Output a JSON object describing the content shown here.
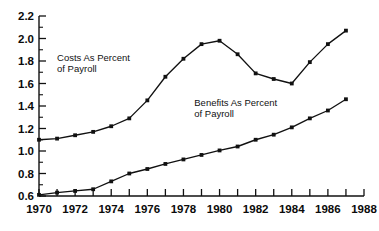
{
  "chart_data": {
    "type": "line",
    "title": "",
    "subtitle": "",
    "xlabel": "",
    "ylabel": "",
    "xlim": [
      1970,
      1988
    ],
    "ylim": [
      0.6,
      2.2
    ],
    "grid": false,
    "legend_position": "inline-annotation",
    "x_tick_interval": 1,
    "x_label_interval": 2,
    "y_major_interval": 0.2,
    "y_minor_interval": 0.1,
    "marker": "filled-square",
    "line_color": "#111111",
    "x": [
      1970,
      1971,
      1972,
      1973,
      1974,
      1975,
      1976,
      1977,
      1978,
      1979,
      1980,
      1981,
      1982,
      1983,
      1984,
      1985,
      1986,
      1987
    ],
    "xtick_values": [
      1970,
      1971,
      1972,
      1973,
      1974,
      1975,
      1976,
      1977,
      1978,
      1979,
      1980,
      1981,
      1982,
      1983,
      1984,
      1985,
      1986,
      1987,
      1988
    ],
    "xtick_labels": [
      "1970",
      "1972",
      "1974",
      "1976",
      "1978",
      "1980",
      "1982",
      "1984",
      "1986",
      "1988"
    ],
    "xtick_label_values": [
      1970,
      1972,
      1974,
      1976,
      1978,
      1980,
      1982,
      1984,
      1986,
      1988
    ],
    "ytick_values": [
      0.6,
      0.8,
      1.0,
      1.2,
      1.4,
      1.6,
      1.8,
      2.0,
      2.2
    ],
    "ytick_labels": [
      "0.6",
      "0.8",
      "1.0",
      "1.2",
      "1.4",
      "1.6",
      "1.8",
      "2.0",
      "2.2"
    ],
    "yminor_values": [
      0.7,
      0.9,
      1.1,
      1.3,
      1.5,
      1.7,
      1.9,
      2.1
    ],
    "series": [
      {
        "name": "Costs As Percent of Payroll",
        "label_line1": "Costs As Percent",
        "label_line2": "of Payroll",
        "label_x": 1971.0,
        "label_y": 1.8,
        "values": [
          1.1,
          1.11,
          1.14,
          1.17,
          1.22,
          1.29,
          1.45,
          1.66,
          1.82,
          1.95,
          1.98,
          1.86,
          1.69,
          1.64,
          1.6,
          1.79,
          1.95,
          2.07
        ]
      },
      {
        "name": "Benefits As Percent of Payroll",
        "label_line1": "Benefits As Percent",
        "label_line2": "of Payroll",
        "label_x": 1978.6,
        "label_y": 1.4,
        "values": [
          0.61,
          0.63,
          0.645,
          0.66,
          0.73,
          0.8,
          0.84,
          0.885,
          0.925,
          0.965,
          1.005,
          1.04,
          1.1,
          1.145,
          1.21,
          1.29,
          1.36,
          1.46
        ]
      }
    ]
  }
}
